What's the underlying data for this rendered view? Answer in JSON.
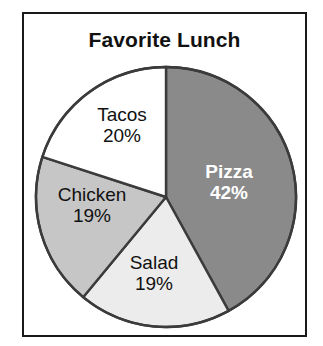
{
  "chart_data": {
    "type": "pie",
    "title": "Favorite Lunch",
    "categories": [
      "Pizza",
      "Salad",
      "Chicken",
      "Tacos"
    ],
    "values": [
      42,
      19,
      19,
      20
    ],
    "value_labels": [
      "42%",
      "19%",
      "19%",
      "20%"
    ],
    "unit": "%",
    "start_angle_deg": 0,
    "direction": "clockwise",
    "legend": "none",
    "grid": false,
    "xlabel": "",
    "ylabel": "",
    "slices": [
      {
        "name": "Pizza",
        "value": 42,
        "value_label": "42%",
        "color": "#8a8a8a",
        "label_color": "#ffffff",
        "start_deg": 0,
        "end_deg": 151.2
      },
      {
        "name": "Salad",
        "value": 19,
        "value_label": "19%",
        "color": "#ececec",
        "label_color": "#111111",
        "start_deg": 151.2,
        "end_deg": 219.6
      },
      {
        "name": "Chicken",
        "value": 19,
        "value_label": "19%",
        "color": "#c6c6c6",
        "label_color": "#111111",
        "start_deg": 219.6,
        "end_deg": 288.0
      },
      {
        "name": "Tacos",
        "value": 20,
        "value_label": "20%",
        "color": "#ffffff",
        "label_color": "#111111",
        "start_deg": 288.0,
        "end_deg": 360.0
      }
    ],
    "colors": {
      "outline": "#3b3b3b",
      "frame_border": "#1a1a1a",
      "background": "#ffffff",
      "title_text": "#111111"
    }
  }
}
